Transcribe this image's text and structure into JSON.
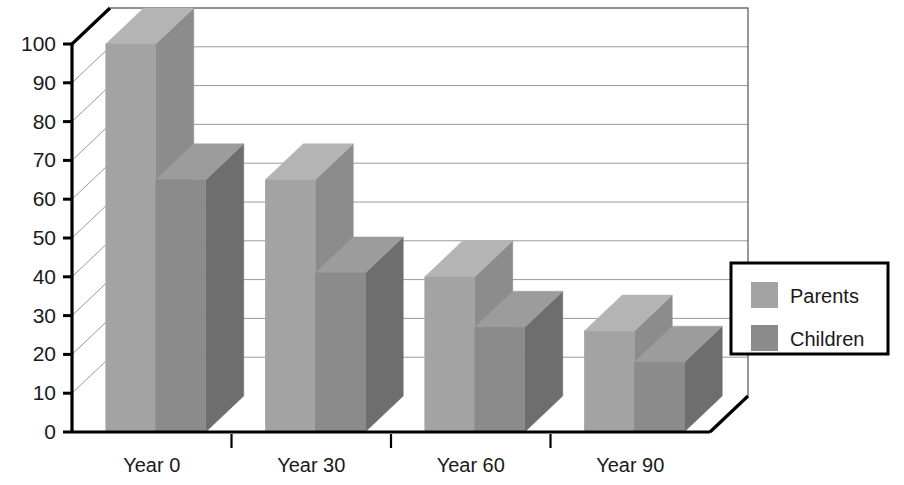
{
  "chart_data": {
    "type": "bar",
    "title": "",
    "subtitle": "",
    "xlabel": "",
    "ylabel": "",
    "categories": [
      "Year 0",
      "Year 30",
      "Year 60",
      "Year 90"
    ],
    "series": [
      {
        "name": "Parents",
        "values": [
          100,
          65,
          40,
          26
        ],
        "color": "#a3a3a3"
      },
      {
        "name": "Children",
        "values": [
          65,
          41,
          27,
          18
        ],
        "color": "#8b8b8b"
      }
    ],
    "ylim": [
      0,
      100
    ],
    "yticks": [
      0,
      10,
      20,
      30,
      40,
      50,
      60,
      70,
      80,
      90,
      100
    ],
    "ytick_labels": [
      "0",
      "10",
      "20",
      "30",
      "40",
      "50",
      "60",
      "70",
      "80",
      "90",
      "100"
    ],
    "grid": true,
    "grid_axis": "y",
    "legend": [
      "Parents",
      "Children"
    ],
    "legend_position": "right",
    "style": "3d-column",
    "colors": {
      "parents_front": "#a3a3a3",
      "parents_top": "#b4b4b4",
      "parents_side": "#8c8c8c",
      "children_front": "#8b8b8b",
      "children_top": "#9c9c9c",
      "children_side": "#6e6e6e",
      "axis": "#000000",
      "gridline": "#9a9a9a",
      "background": "#ffffff",
      "text": "#1a1a1a"
    }
  },
  "legend": {
    "items": [
      {
        "label": "Parents"
      },
      {
        "label": "Children"
      }
    ]
  },
  "axis": {
    "y_tick_labels": [
      "100",
      "90",
      "80",
      "70",
      "60",
      "50",
      "40",
      "30",
      "20",
      "10",
      "0"
    ],
    "x_tick_labels": [
      "Year 0",
      "Year 30",
      "Year 60",
      "Year 90"
    ]
  }
}
